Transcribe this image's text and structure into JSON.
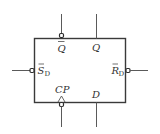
{
  "diagram": {
    "type": "d-flip-flop-symbol",
    "colors": {
      "line": "#3a3a3a",
      "text": "#333333",
      "background": "#ffffff"
    },
    "pins": {
      "q_bar": {
        "label": "Q",
        "overbar": true,
        "side": "top",
        "inverted": true
      },
      "q": {
        "label": "Q",
        "overbar": false,
        "side": "top",
        "inverted": false
      },
      "s_d_bar": {
        "label": "S",
        "subscript": "D",
        "overbar": true,
        "side": "left",
        "inverted": true
      },
      "r_d_bar": {
        "label": "R",
        "subscript": "D",
        "overbar": true,
        "side": "right",
        "inverted": true
      },
      "cp": {
        "label": "CP",
        "side": "bottom",
        "inverted": true,
        "clock": true
      },
      "d": {
        "label": "D",
        "side": "bottom",
        "inverted": false
      }
    }
  }
}
